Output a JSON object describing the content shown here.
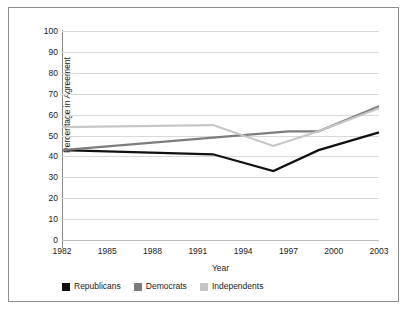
{
  "chart_data": {
    "type": "line",
    "title": "",
    "xlabel": "Year",
    "ylabel": "Percentage in Agreement",
    "xlim": [
      1982,
      2003
    ],
    "ylim": [
      0,
      100
    ],
    "grid": true,
    "legend_position": "bottom-left",
    "xticks": [
      "1982",
      "1985",
      "1988",
      "1991",
      "1994",
      "1997",
      "2000",
      "2003"
    ],
    "xtick_values": [
      1982,
      1985,
      1988,
      1991,
      1994,
      1997,
      2000,
      2003
    ],
    "yticks": [
      "0",
      "10",
      "20",
      "30",
      "40",
      "50",
      "60",
      "70",
      "80",
      "90",
      "100"
    ],
    "ytick_values": [
      0,
      10,
      20,
      30,
      40,
      50,
      60,
      70,
      80,
      90,
      100
    ],
    "series": [
      {
        "name": "Republicans",
        "color": "#111111",
        "x": [
          1982,
          1992,
          1996,
          1999,
          2003
        ],
        "values": [
          43,
          41,
          33,
          43,
          51.5
        ]
      },
      {
        "name": "Democrats",
        "color": "#7d7d7d",
        "x": [
          1982,
          1997,
          1999,
          2003
        ],
        "values": [
          43,
          52,
          52,
          64
        ]
      },
      {
        "name": "Independents",
        "color": "#c6c6c6",
        "x": [
          1982,
          1992,
          1996,
          1999,
          2003
        ],
        "values": [
          54,
          55,
          45,
          52,
          63
        ]
      }
    ]
  },
  "legend": {
    "items": [
      {
        "label": "Republicans",
        "color": "#111111"
      },
      {
        "label": "Democrats",
        "color": "#7d7d7d"
      },
      {
        "label": "Independents",
        "color": "#c6c6c6"
      }
    ]
  }
}
